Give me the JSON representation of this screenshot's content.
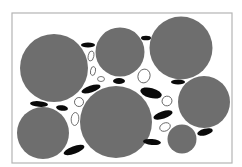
{
  "figure": {
    "colors": {
      "background": "#ffffff",
      "frame": "#b4b4b4",
      "large_particle": "#6e6e6e",
      "small_particle": "#0a0a0a",
      "void_outline": "#555555"
    },
    "frame": {
      "x": 12,
      "y": 13,
      "w": 220,
      "h": 150
    },
    "large_particles": [
      {
        "cx": 54,
        "cy": 68,
        "r": 34
      },
      {
        "cx": 120,
        "cy": 52,
        "r": 24.5
      },
      {
        "cx": 181,
        "cy": 48,
        "r": 31.5
      },
      {
        "cx": 204,
        "cy": 102,
        "r": 26
      },
      {
        "cx": 116,
        "cy": 122,
        "r": 36
      },
      {
        "cx": 43,
        "cy": 133,
        "r": 26
      },
      {
        "cx": 182,
        "cy": 139,
        "r": 14.5
      }
    ],
    "black_particles": [
      {
        "cx": 88,
        "cy": 45,
        "rx": 7,
        "ry": 2.5,
        "rot": 0
      },
      {
        "cx": 146,
        "cy": 38,
        "rx": 5,
        "ry": 2.3,
        "rot": 0
      },
      {
        "cx": 119,
        "cy": 81,
        "rx": 6,
        "ry": 3,
        "rot": 0
      },
      {
        "cx": 91,
        "cy": 89,
        "rx": 10,
        "ry": 3.3,
        "rot": -18
      },
      {
        "cx": 151,
        "cy": 93,
        "rx": 11,
        "ry": 5,
        "rot": 15
      },
      {
        "cx": 178,
        "cy": 82,
        "rx": 7,
        "ry": 2.5,
        "rot": 0
      },
      {
        "cx": 39,
        "cy": 104,
        "rx": 9,
        "ry": 2.8,
        "rot": 5
      },
      {
        "cx": 62,
        "cy": 108,
        "rx": 6,
        "ry": 2.7,
        "rot": 10
      },
      {
        "cx": 163,
        "cy": 115,
        "rx": 10,
        "ry": 3.8,
        "rot": -18
      },
      {
        "cx": 205,
        "cy": 132,
        "rx": 8,
        "ry": 3.3,
        "rot": -15
      },
      {
        "cx": 152,
        "cy": 142,
        "rx": 9,
        "ry": 3,
        "rot": 5
      },
      {
        "cx": 74,
        "cy": 150,
        "rx": 11,
        "ry": 3.8,
        "rot": -20
      }
    ],
    "hollow_particles": [
      {
        "cx": 91,
        "cy": 56,
        "rx": 2.8,
        "ry": 5,
        "rot": 10
      },
      {
        "cx": 93,
        "cy": 71,
        "rx": 2.5,
        "ry": 4.5,
        "rot": 10
      },
      {
        "cx": 101,
        "cy": 79,
        "rx": 3.5,
        "ry": 2.5,
        "rot": 0
      },
      {
        "cx": 144,
        "cy": 76,
        "rx": 6,
        "ry": 7,
        "rot": 20
      },
      {
        "cx": 167,
        "cy": 101,
        "rx": 5,
        "ry": 4.8,
        "rot": -30
      },
      {
        "cx": 79,
        "cy": 102,
        "rx": 4.5,
        "ry": 4.5,
        "rot": -25
      },
      {
        "cx": 75,
        "cy": 119,
        "rx": 3.8,
        "ry": 6.5,
        "rot": 5
      },
      {
        "cx": 165,
        "cy": 127,
        "rx": 5.5,
        "ry": 4,
        "rot": -25
      }
    ]
  }
}
